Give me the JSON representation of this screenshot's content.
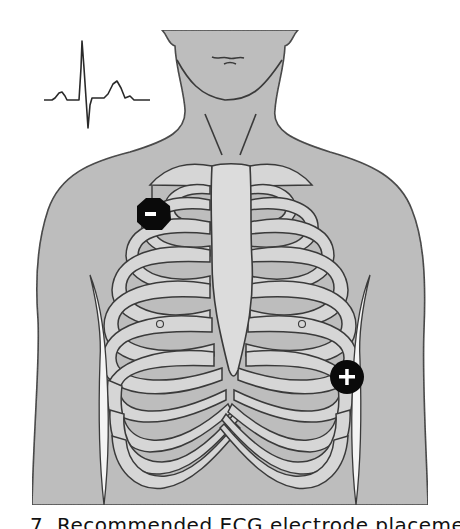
{
  "figure": {
    "ecg_trace": {
      "label": "ECG waveform (P-QRS-T)"
    },
    "electrodes": [
      {
        "name": "negative-electrode",
        "symbol": "-",
        "position": "right infraclavicular (upper left of image)"
      },
      {
        "name": "positive-electrode",
        "symbol": "+",
        "position": "left lower lateral chest (lower right of image)"
      }
    ],
    "colors": {
      "skin": "#bdbdbd",
      "bone": "#d9d9d9",
      "outline": "#3a3a3a",
      "electrode": "#0a0a0a",
      "electrode_symbol": "#ffffff",
      "background": "#ffffff"
    }
  },
  "caption": {
    "text": "7. Recommended ECG electrode placement"
  }
}
